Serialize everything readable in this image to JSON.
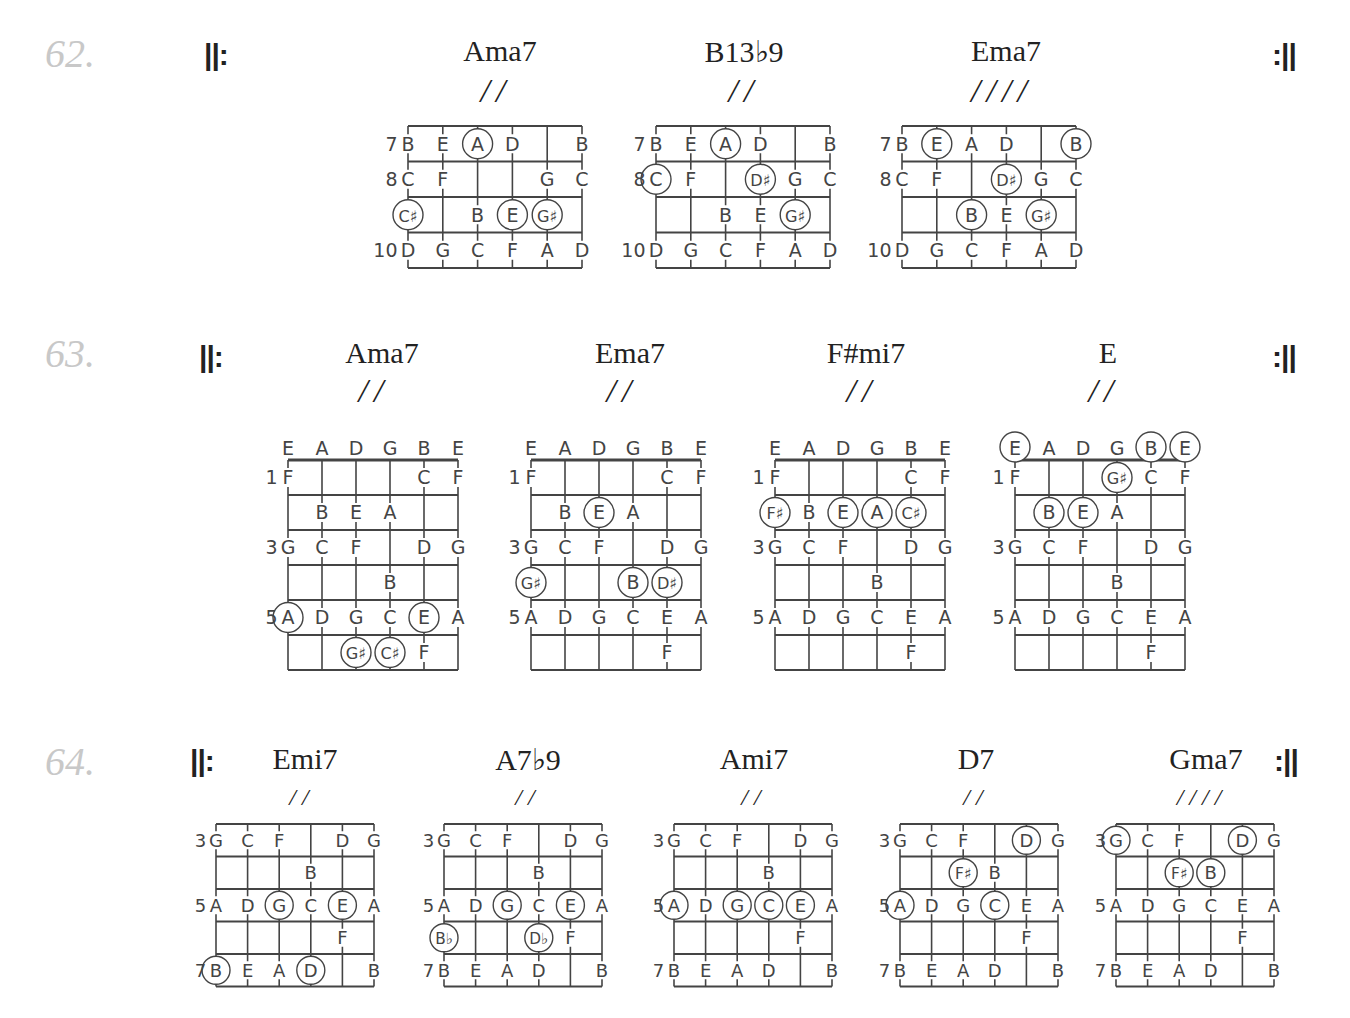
{
  "page": {
    "exercises": [
      {
        "number": "62.",
        "repeat_start": "||:",
        "repeat_end": ":||",
        "chords": [
          {
            "name": "Ama7",
            "slashes": "//",
            "start_fret": 7,
            "frets_shown": 4,
            "open_labels": false,
            "fret_labels": {
              "7": "7",
              "8": "8",
              "10": "10"
            },
            "rows": [
              [
                "B",
                "E",
                "A",
                "D",
                "",
                "B"
              ],
              [
                "C",
                "F",
                "",
                "",
                "G",
                "C"
              ],
              [
                "C♯",
                "",
                "B",
                "E",
                "G♯",
                ""
              ],
              [
                "D",
                "G",
                "C",
                "F",
                "A",
                "D"
              ]
            ],
            "circled": [
              [
                0,
                2
              ],
              [
                2,
                0
              ],
              [
                2,
                3
              ],
              [
                2,
                4
              ]
            ]
          },
          {
            "name": "B13♭9",
            "slashes": "//",
            "start_fret": 7,
            "frets_shown": 4,
            "open_labels": false,
            "fret_labels": {
              "7": "7",
              "8": "8",
              "10": "10"
            },
            "rows": [
              [
                "B",
                "E",
                "A",
                "D",
                "",
                "B"
              ],
              [
                "C",
                "F",
                "",
                "D♯",
                "G",
                "C"
              ],
              [
                "",
                "",
                "B",
                "E",
                "G♯",
                ""
              ],
              [
                "D",
                "G",
                "C",
                "F",
                "A",
                "D"
              ]
            ],
            "circled": [
              [
                0,
                2
              ],
              [
                1,
                0
              ],
              [
                1,
                3
              ],
              [
                2,
                4
              ]
            ]
          },
          {
            "name": "Ema7",
            "slashes": "////",
            "start_fret": 7,
            "frets_shown": 4,
            "open_labels": false,
            "fret_labels": {
              "7": "7",
              "8": "8",
              "10": "10"
            },
            "rows": [
              [
                "B",
                "E",
                "A",
                "D",
                "",
                "B"
              ],
              [
                "C",
                "F",
                "",
                "D♯",
                "G",
                "C"
              ],
              [
                "",
                "",
                "B",
                "E",
                "G♯",
                ""
              ],
              [
                "D",
                "G",
                "C",
                "F",
                "A",
                "D"
              ]
            ],
            "circled": [
              [
                0,
                1
              ],
              [
                0,
                5
              ],
              [
                1,
                3
              ],
              [
                2,
                2
              ],
              [
                2,
                4
              ]
            ]
          }
        ]
      },
      {
        "number": "63.",
        "repeat_start": "||:",
        "repeat_end": ":||",
        "chords": [
          {
            "name": "Ama7",
            "slashes": "//",
            "start_fret": 1,
            "frets_shown": 6,
            "open_labels": true,
            "open": [
              "E",
              "A",
              "D",
              "G",
              "B",
              "E"
            ],
            "fret_labels": {
              "1": "1",
              "3": "3",
              "5": "5"
            },
            "rows": [
              [
                "F",
                "",
                "",
                "",
                "C",
                "F"
              ],
              [
                "",
                "B",
                "E",
                "A",
                "",
                ""
              ],
              [
                "G",
                "C",
                "F",
                "",
                "D",
                "G"
              ],
              [
                "",
                "",
                "",
                "B",
                "",
                ""
              ],
              [
                "A",
                "D",
                "G",
                "C",
                "E",
                "A"
              ],
              [
                "",
                "",
                "G♯",
                "C♯",
                "F",
                ""
              ]
            ],
            "circled_open": [],
            "circled": [
              [
                4,
                0
              ],
              [
                4,
                4
              ],
              [
                5,
                2
              ],
              [
                5,
                3
              ]
            ]
          },
          {
            "name": "Ema7",
            "slashes": "//",
            "start_fret": 1,
            "frets_shown": 6,
            "open_labels": true,
            "open": [
              "E",
              "A",
              "D",
              "G",
              "B",
              "E"
            ],
            "fret_labels": {
              "1": "1",
              "3": "3",
              "5": "5"
            },
            "rows": [
              [
                "F",
                "",
                "",
                "",
                "C",
                "F"
              ],
              [
                "",
                "B",
                "E",
                "A",
                "",
                ""
              ],
              [
                "G",
                "C",
                "F",
                "",
                "D",
                "G"
              ],
              [
                "G♯",
                "",
                "",
                "B",
                "D♯",
                ""
              ],
              [
                "A",
                "D",
                "G",
                "C",
                "E",
                "A"
              ],
              [
                "",
                "",
                "",
                "",
                "F",
                ""
              ]
            ],
            "circled_open": [],
            "circled": [
              [
                1,
                2
              ],
              [
                3,
                0
              ],
              [
                3,
                3
              ],
              [
                3,
                4
              ]
            ]
          },
          {
            "name": "F#mi7",
            "slashes": "//",
            "start_fret": 1,
            "frets_shown": 6,
            "open_labels": true,
            "open": [
              "E",
              "A",
              "D",
              "G",
              "B",
              "E"
            ],
            "fret_labels": {
              "1": "1",
              "3": "3",
              "5": "5"
            },
            "rows": [
              [
                "F",
                "",
                "",
                "",
                "C",
                "F"
              ],
              [
                "F♯",
                "B",
                "E",
                "A",
                "C♯",
                ""
              ],
              [
                "G",
                "C",
                "F",
                "",
                "D",
                "G"
              ],
              [
                "",
                "",
                "",
                "B",
                "",
                ""
              ],
              [
                "A",
                "D",
                "G",
                "C",
                "E",
                "A"
              ],
              [
                "",
                "",
                "",
                "",
                "F",
                ""
              ]
            ],
            "circled_open": [],
            "circled": [
              [
                1,
                0
              ],
              [
                1,
                2
              ],
              [
                1,
                3
              ],
              [
                1,
                4
              ]
            ]
          },
          {
            "name": "E",
            "slashes": "//",
            "start_fret": 1,
            "frets_shown": 6,
            "open_labels": true,
            "open": [
              "E",
              "A",
              "D",
              "G",
              "B",
              "E"
            ],
            "fret_labels": {
              "1": "1",
              "3": "3",
              "5": "5"
            },
            "rows": [
              [
                "F",
                "",
                "",
                "G♯",
                "C",
                "F"
              ],
              [
                "",
                "B",
                "E",
                "A",
                "",
                ""
              ],
              [
                "G",
                "C",
                "F",
                "",
                "D",
                "G"
              ],
              [
                "",
                "",
                "",
                "B",
                "",
                ""
              ],
              [
                "A",
                "D",
                "G",
                "C",
                "E",
                "A"
              ],
              [
                "",
                "",
                "",
                "",
                "F",
                ""
              ]
            ],
            "circled_open": [
              0,
              4,
              5
            ],
            "circled": [
              [
                0,
                3
              ],
              [
                1,
                1
              ],
              [
                1,
                2
              ]
            ]
          }
        ]
      },
      {
        "number": "64.",
        "repeat_start": "||:",
        "repeat_end": ":||",
        "chords": [
          {
            "name": "Emi7",
            "slashes": "//",
            "start_fret": 3,
            "frets_shown": 5,
            "open_labels": false,
            "fret_labels": {
              "3": "3",
              "5": "5",
              "7": "7"
            },
            "rows": [
              [
                "G",
                "C",
                "F",
                "",
                "D",
                "G"
              ],
              [
                "",
                "",
                "",
                "B",
                "",
                ""
              ],
              [
                "A",
                "D",
                "G",
                "C",
                "E",
                "A"
              ],
              [
                "",
                "",
                "",
                "",
                "F",
                ""
              ],
              [
                "B",
                "E",
                "A",
                "D",
                "",
                "B"
              ]
            ],
            "circled": [
              [
                2,
                2
              ],
              [
                2,
                4
              ],
              [
                4,
                0
              ],
              [
                4,
                3
              ]
            ]
          },
          {
            "name": "A7♭9",
            "slashes": "//",
            "start_fret": 3,
            "frets_shown": 5,
            "open_labels": false,
            "fret_labels": {
              "3": "3",
              "5": "5",
              "7": "7"
            },
            "rows": [
              [
                "G",
                "C",
                "F",
                "",
                "D",
                "G"
              ],
              [
                "",
                "",
                "",
                "B",
                "",
                ""
              ],
              [
                "A",
                "D",
                "G",
                "C",
                "E",
                "A"
              ],
              [
                "B♭",
                "",
                "",
                "D♭",
                "F",
                ""
              ],
              [
                "B",
                "E",
                "A",
                "D",
                "",
                "B"
              ]
            ],
            "circled": [
              [
                2,
                2
              ],
              [
                2,
                4
              ],
              [
                3,
                0
              ],
              [
                3,
                3
              ]
            ]
          },
          {
            "name": "Ami7",
            "slashes": "//",
            "start_fret": 3,
            "frets_shown": 5,
            "open_labels": false,
            "fret_labels": {
              "3": "3",
              "5": "5",
              "7": "7"
            },
            "rows": [
              [
                "G",
                "C",
                "F",
                "",
                "D",
                "G"
              ],
              [
                "",
                "",
                "",
                "B",
                "",
                ""
              ],
              [
                "A",
                "D",
                "G",
                "C",
                "E",
                "A"
              ],
              [
                "",
                "",
                "",
                "",
                "F",
                ""
              ],
              [
                "B",
                "E",
                "A",
                "D",
                "",
                "B"
              ]
            ],
            "circled": [
              [
                2,
                0
              ],
              [
                2,
                2
              ],
              [
                2,
                3
              ],
              [
                2,
                4
              ]
            ]
          },
          {
            "name": "D7",
            "slashes": "//",
            "start_fret": 3,
            "frets_shown": 5,
            "open_labels": false,
            "fret_labels": {
              "3": "3",
              "5": "5",
              "7": "7"
            },
            "rows": [
              [
                "G",
                "C",
                "F",
                "",
                "D",
                "G"
              ],
              [
                "",
                "",
                "F♯",
                "B",
                "",
                ""
              ],
              [
                "A",
                "D",
                "G",
                "C",
                "E",
                "A"
              ],
              [
                "",
                "",
                "",
                "",
                "F",
                ""
              ],
              [
                "B",
                "E",
                "A",
                "D",
                "",
                "B"
              ]
            ],
            "circled": [
              [
                0,
                4
              ],
              [
                1,
                2
              ],
              [
                2,
                0
              ],
              [
                2,
                3
              ]
            ]
          },
          {
            "name": "Gma7",
            "slashes": "////",
            "start_fret": 3,
            "frets_shown": 5,
            "open_labels": false,
            "fret_labels": {
              "3": "3",
              "5": "5",
              "7": "7"
            },
            "rows": [
              [
                "G",
                "C",
                "F",
                "",
                "D",
                "G"
              ],
              [
                "",
                "",
                "F♯",
                "B",
                "",
                ""
              ],
              [
                "A",
                "D",
                "G",
                "C",
                "E",
                "A"
              ],
              [
                "",
                "",
                "",
                "",
                "F",
                ""
              ],
              [
                "B",
                "E",
                "A",
                "D",
                "",
                "B"
              ]
            ],
            "circled": [
              [
                0,
                0
              ],
              [
                0,
                4
              ],
              [
                1,
                2
              ],
              [
                1,
                3
              ]
            ]
          }
        ]
      }
    ]
  }
}
